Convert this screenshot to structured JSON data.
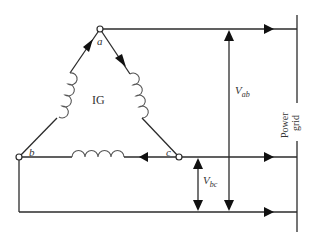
{
  "diagram": {
    "generator_label": "IG",
    "nodes": {
      "a": "a",
      "b": "b",
      "c": "c"
    },
    "voltages": {
      "vab": {
        "symbol": "V",
        "subscript": "ab"
      },
      "vbc": {
        "symbol": "V",
        "subscript": "bc"
      }
    },
    "grid_label": {
      "line1": "Power",
      "line2": "grid"
    },
    "colors": {
      "line": "#2b2b2b",
      "coil": "#555555",
      "background": "#ffffff"
    }
  }
}
